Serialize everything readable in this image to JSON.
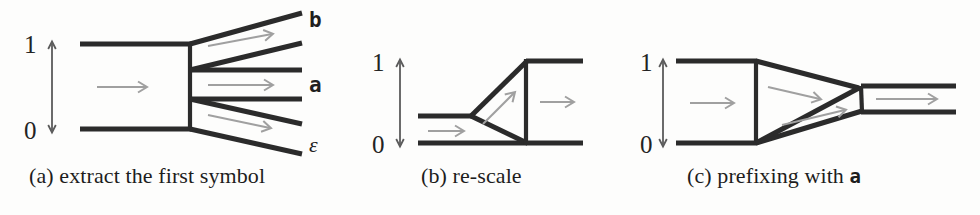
{
  "figure": {
    "background_color": "#fdfdfc",
    "line_color": "#2b2b2b",
    "arrow_color": "#a0a0a0",
    "axis_color": "#5b5b5b",
    "text_color": "#1d1d1d"
  },
  "panels": [
    {
      "id": "a",
      "caption_prefix": "(a)",
      "caption_text": "extract the first symbol",
      "axis": {
        "top_label": "1",
        "bottom_label": "0"
      },
      "branch_labels": [
        {
          "name": "b",
          "text": "b",
          "style": "mono"
        },
        {
          "name": "a",
          "text": "a",
          "style": "mono"
        },
        {
          "name": "epsilon",
          "text": "ε",
          "style": "italic-serif"
        }
      ],
      "flow_arrow_count": 4
    },
    {
      "id": "b",
      "caption_prefix": "(b)",
      "caption_text": "re-scale",
      "axis": {
        "top_label": "1",
        "bottom_label": "0"
      },
      "branch_labels": [],
      "flow_arrow_count": 3
    },
    {
      "id": "c",
      "caption_prefix": "(c)",
      "caption_text_before": "prefixing with",
      "caption_mono": "a",
      "axis": {
        "top_label": "1",
        "bottom_label": "0"
      },
      "branch_labels": [],
      "flow_arrow_count": 4
    }
  ],
  "captions": {
    "a": "(a) extract the first symbol",
    "b": "(b) re-scale",
    "c_before": "(c) prefixing with ",
    "c_mono": "a"
  },
  "labels": {
    "one": "1",
    "zero": "0",
    "b": "b",
    "a": "a",
    "epsilon": "ε"
  }
}
